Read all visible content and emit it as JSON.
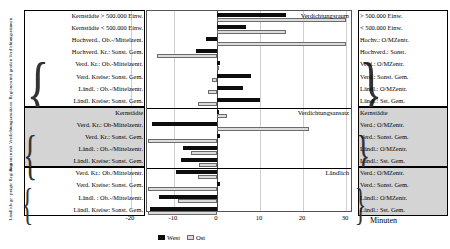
{
  "groups": [
    {
      "caption": "Regionen mit großen Verdichtungsräumen",
      "annotation": "Verdichtungsraum",
      "rows": [
        {
          "left": "Kernstädte > 500.000 Einw.",
          "right": "> 500.000 Einw.",
          "west": 16.0,
          "ost": 30.0
        },
        {
          "left": "Kernstädte < 500.000 Einw.",
          "right": "< 500.000 Einw.",
          "west": 6.8,
          "ost": 16.0
        },
        {
          "left": "Hochverd.. Ob.-/Mittelzent.",
          "right": "Hochv.: O/MZentr.",
          "west": -2.6,
          "ost": 30.0
        },
        {
          "left": "Hochverd. Kr.: Sonst. Gem.",
          "right": "Hochverd.: Sonst.",
          "west": -5.0,
          "ost": -14.0
        },
        {
          "left": "Verd. Kr.: Ob.-Mittelzentr.",
          "right": "Verd.: O/MZentr.",
          "west": 0.7,
          "ost": 0.4
        },
        {
          "left": "Verd. Kreise: Sonst. Gem.",
          "right": "Verd.: Sonst. Gem.",
          "west": 8.0,
          "ost": -1.2
        },
        {
          "left": "Ländl. : Ob.-/Mittelzentr.",
          "right": "Ländl.: O/MZentr.",
          "west": 6.0,
          "ost": -2.0
        },
        {
          "left": "Ländl. Kreise: Sonst. Gem.",
          "right": "Ländl.: Sst. Gem.",
          "west": 10.0,
          "ost": -4.5
        }
      ]
    },
    {
      "caption": "Regionen mit Verdichtungsansätzen",
      "annotation": "Verdichtungsansatz",
      "rows": [
        {
          "left": "Kernstädte",
          "right": "Kernstädte",
          "west": 0.4,
          "ost": 2.4
        },
        {
          "left": "Verd. Kr.: Ob-Mittelzentr.",
          "right": "Verd.: O/MZentr.",
          "west": -15.2,
          "ost": 21.5
        },
        {
          "left": "Verd. Kr.: Sonst. Gem.",
          "right": "Verd.: Sonst. Gem.",
          "west": 0.6,
          "ost": -20.5
        },
        {
          "left": "Ländl. : Ob.-/Mittelzentr.",
          "right": "Ländl.: O/MZentr.",
          "west": -8.0,
          "ost": -6.0
        },
        {
          "left": "Ländl. Kreise: Sonst. Gem.",
          "right": "Ländl.: Sst. Gem.",
          "west": -8.3,
          "ost": -4.3
        }
      ]
    },
    {
      "caption": "Ländlich ge- prägte Regionen",
      "annotation": "Ländlich",
      "rows": [
        {
          "left": "Verd. Kr.: Ob./Mittelzentr.",
          "right": "Verd.: O/MZentr.",
          "west": -9.5,
          "ost": -4.5
        },
        {
          "left": "Verd. Kreise: Sonst. Gem.",
          "right": "Verd.: Sonst. Gem.",
          "west": 0.6,
          "ost": -20.5
        },
        {
          "left": "Ländl. : Ob.-/Mittelzentr.",
          "right": "Ländl.: O/MZentr.",
          "west": -13.5,
          "ost": -9.0
        },
        {
          "left": "Ländl. Kreise: Sonst. Gem.",
          "right": "Ländl.: Sst. Gem.",
          "west": -15.5,
          "ost": -19.5
        }
      ]
    }
  ],
  "axis": {
    "ticks": [
      "-20",
      "-10",
      "0",
      "10",
      "20",
      "30"
    ],
    "tick_values": [
      -20,
      -10,
      0,
      10,
      20,
      30
    ],
    "title": "Minuten",
    "min": -21.5,
    "max": 31.5
  },
  "legend": [
    {
      "label": "West",
      "key": "west",
      "color": "#0d0d0d"
    },
    {
      "label": "Ost",
      "key": "ost",
      "color": "#dcdcdc"
    }
  ],
  "chart_data": {
    "type": "bar",
    "orientation": "horizontal",
    "title": "",
    "xlabel": "Minuten",
    "ylabel": "",
    "xlim": [
      -21.5,
      31.5
    ],
    "grid": true,
    "legend_position": "bottom",
    "categories": [
      "Kernstädte > 500.000 Einw.",
      "Kernstädte < 500.000 Einw.",
      "Hochverd.. Ob.-/Mittelzent.",
      "Hochverd. Kr.: Sonst. Gem.",
      "Verd. Kr.: Ob.-Mittelzentr.",
      "Verd. Kreise: Sonst. Gem.",
      "Ländl. : Ob.-/Mittelzentr.",
      "Ländl. Kreise: Sonst. Gem.",
      "Kernstädte",
      "Verd. Kr.: Ob-Mittelzentr.",
      "Verd. Kr.: Sonst. Gem.",
      "Ländl. : Ob.-/Mittelzentr.",
      "Ländl. Kreise: Sonst. Gem.",
      "Verd. Kr.: Ob./Mittelzentr.",
      "Verd. Kreise: Sonst. Gem.",
      "Ländl. : Ob.-/Mittelzentr.",
      "Ländl. Kreise: Sonst. Gem."
    ],
    "series": [
      {
        "name": "West",
        "values": [
          16.0,
          6.8,
          -2.6,
          -5.0,
          0.7,
          8.0,
          6.0,
          10.0,
          0.4,
          -15.2,
          0.6,
          -8.0,
          -8.3,
          -9.5,
          0.6,
          -13.5,
          -15.5
        ]
      },
      {
        "name": "Ost",
        "values": [
          30.0,
          16.0,
          30.0,
          -14.0,
          0.4,
          -1.2,
          -2.0,
          -4.5,
          2.4,
          21.5,
          -20.5,
          -6.0,
          -4.3,
          -4.5,
          -20.5,
          -9.0,
          -19.5
        ]
      }
    ]
  }
}
